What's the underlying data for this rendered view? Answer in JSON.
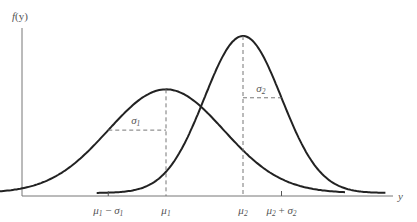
{
  "chart_data": {
    "type": "line",
    "title": "",
    "xlabel": "y",
    "ylabel": "f(y)",
    "grid": false,
    "legend": "none",
    "series": [
      {
        "name": "distribution-1",
        "mu": 4,
        "sigma": 1.5,
        "mu_label": "μ1",
        "sigma_label": "σ1"
      },
      {
        "name": "distribution-2",
        "mu": 6,
        "sigma": 1,
        "mu_label": "μ2",
        "sigma_label": "σ2"
      }
    ],
    "xlim": [
      0,
      10
    ],
    "x_tick_labels": [
      {
        "at": "mu1-sigma1",
        "text": "μ1 − σ1"
      },
      {
        "at": "mu1",
        "text": "μ1"
      },
      {
        "at": "mu2",
        "text": "μ2"
      },
      {
        "at": "mu2+sigma2",
        "text": "μ2 + σ2"
      }
    ],
    "annotations": [
      "σ1",
      "σ2"
    ]
  },
  "labels": {
    "ylabel_f": "f",
    "ylabel_y": "(y)",
    "xlabel": "y",
    "mu": "μ",
    "sigma": "σ",
    "minus": " − ",
    "plus": " + ",
    "one": "1",
    "two": "2"
  }
}
